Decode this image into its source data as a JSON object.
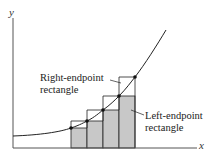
{
  "diagram": {
    "axes": {
      "x_label": "x",
      "y_label": "y"
    },
    "labels": {
      "right_endpoint": [
        "Right-endpoint",
        "rectangle"
      ],
      "left_endpoint": [
        "Left-endpoint",
        "rectangle"
      ]
    },
    "colors": {
      "fill": "#c8c8c8",
      "stroke": "#222222",
      "axis": "#555555"
    },
    "partition_x": [
      71,
      87,
      103,
      119,
      135
    ],
    "curve_points_y": [
      128,
      121,
      110,
      96,
      77
    ],
    "baseline_y": 148
  }
}
